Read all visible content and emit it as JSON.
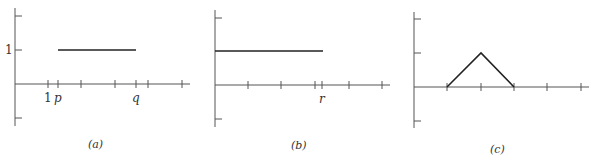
{
  "panels": [
    {
      "id": "a",
      "caption": "(a)",
      "y_tick_label": "1",
      "x_labels": {
        "one": "1",
        "p": "p",
        "q": "q"
      },
      "description": "Horizontal segment at height 1 from p to q"
    },
    {
      "id": "b",
      "caption": "(b)",
      "x_labels": {
        "r": "r"
      },
      "description": "Horizontal segment at height 1 from 0 to r"
    },
    {
      "id": "c",
      "caption": "(c)",
      "description": "Triangle (hat) function rising from 1 to peak at 2, falling to 3"
    }
  ]
}
